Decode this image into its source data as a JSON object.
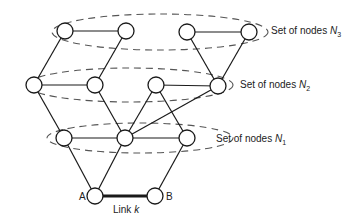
{
  "diagram": {
    "sets": [
      {
        "id": "N3",
        "label_prefix": "Set of nodes ",
        "symbol": "N",
        "subscript": "3",
        "cx": 160,
        "cy": 32,
        "rx": 108,
        "ry": 18,
        "label_x": 271,
        "label_y": 34
      },
      {
        "id": "N2",
        "label_prefix": "Set of nodes ",
        "symbol": "N",
        "subscript": "2",
        "cx": 130,
        "cy": 85,
        "rx": 103,
        "ry": 17,
        "label_x": 240,
        "label_y": 88
      },
      {
        "id": "N1",
        "label_prefix": "Set of nodes ",
        "symbol": "N",
        "subscript": "1",
        "cx": 140,
        "cy": 138,
        "rx": 93,
        "ry": 15,
        "label_x": 216,
        "label_y": 142
      }
    ],
    "nodes": [
      {
        "id": "n3a",
        "x": 65,
        "y": 31
      },
      {
        "id": "n3b",
        "x": 126,
        "y": 31
      },
      {
        "id": "n3c",
        "x": 187,
        "y": 32
      },
      {
        "id": "n3d",
        "x": 249,
        "y": 32
      },
      {
        "id": "n2a",
        "x": 34,
        "y": 85
      },
      {
        "id": "n2b",
        "x": 95,
        "y": 85
      },
      {
        "id": "n2c",
        "x": 156,
        "y": 85
      },
      {
        "id": "n2d",
        "x": 218,
        "y": 86
      },
      {
        "id": "n1a",
        "x": 64,
        "y": 138
      },
      {
        "id": "n1b",
        "x": 125,
        "y": 138
      },
      {
        "id": "n1c",
        "x": 187,
        "y": 138
      },
      {
        "id": "A",
        "x": 95,
        "y": 196,
        "label": "A",
        "label_x": 79,
        "label_y": 200
      },
      {
        "id": "B",
        "x": 155,
        "y": 196,
        "label": "B",
        "label_x": 166,
        "label_y": 200
      }
    ],
    "edges": [
      [
        "n3a",
        "n3b"
      ],
      [
        "n3c",
        "n3d"
      ],
      [
        "n3a",
        "n2a"
      ],
      [
        "n3b",
        "n2b"
      ],
      [
        "n3c",
        "n2d"
      ],
      [
        "n3d",
        "n2d"
      ],
      [
        "n2a",
        "n2b"
      ],
      [
        "n2c",
        "n2d"
      ],
      [
        "n2a",
        "n1a"
      ],
      [
        "n2b",
        "n1b"
      ],
      [
        "n2c",
        "n1b"
      ],
      [
        "n2c",
        "n1c"
      ],
      [
        "n2d",
        "n1b"
      ],
      [
        "n1a",
        "n1b"
      ],
      [
        "n1b",
        "n1c"
      ],
      [
        "n1a",
        "A"
      ],
      [
        "n1b",
        "A"
      ],
      [
        "n1c",
        "B"
      ]
    ],
    "link": {
      "from": "A",
      "to": "B",
      "label_prefix": "Link ",
      "symbol": "k",
      "label_x": 113,
      "label_y": 213
    }
  }
}
